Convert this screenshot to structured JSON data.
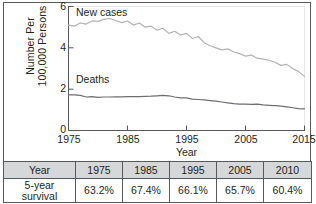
{
  "chart_data": {
    "type": "line",
    "title": "",
    "xlabel": "Year",
    "ylabel": "Number Per 100,000 Persons",
    "ylabel_lines": [
      "Number Per",
      "100,000 Persons"
    ],
    "xlim": [
      1975,
      2015
    ],
    "ylim": [
      0,
      6
    ],
    "yticks": [
      "0",
      "2",
      "4",
      "6"
    ],
    "ytick_values": [
      0,
      2,
      4,
      6
    ],
    "xticks": [
      "1975",
      "1985",
      "1995",
      "2005",
      "2015"
    ],
    "xtick_values": [
      1975,
      1985,
      1995,
      2005,
      2015
    ],
    "grid": false,
    "legend_position": "inline-annotations",
    "annotations": [
      {
        "text": "New cases",
        "x": 1977,
        "y": 5.9
      },
      {
        "text": "Deaths",
        "x": 1977,
        "y": 2.25
      }
    ],
    "series": [
      {
        "name": "New cases",
        "color": "#b3b3b3",
        "x": [
          1975,
          1976,
          1977,
          1978,
          1979,
          1980,
          1981,
          1982,
          1983,
          1984,
          1985,
          1986,
          1987,
          1988,
          1989,
          1990,
          1991,
          1992,
          1993,
          1994,
          1995,
          1996,
          1997,
          1998,
          1999,
          2000,
          2001,
          2002,
          2003,
          2004,
          2005,
          2006,
          2007,
          2008,
          2009,
          2010,
          2011,
          2012,
          2013,
          2014,
          2015
        ],
        "values": [
          5.1,
          5.05,
          5.2,
          5.15,
          5.3,
          5.28,
          5.38,
          5.42,
          5.32,
          5.22,
          5.3,
          5.1,
          5.2,
          5.0,
          5.05,
          4.85,
          4.95,
          4.7,
          4.8,
          4.62,
          4.7,
          4.45,
          4.55,
          4.25,
          4.1,
          4.0,
          3.9,
          3.95,
          3.8,
          3.72,
          3.6,
          3.65,
          3.5,
          3.45,
          3.4,
          3.3,
          3.15,
          3.2,
          3.0,
          2.85,
          2.62
        ]
      },
      {
        "name": "Deaths",
        "color": "#6d6e71",
        "x": [
          1975,
          1976,
          1977,
          1978,
          1979,
          1980,
          1981,
          1982,
          1983,
          1984,
          1985,
          1986,
          1987,
          1988,
          1989,
          1990,
          1991,
          1992,
          1993,
          1994,
          1995,
          1996,
          1997,
          1998,
          1999,
          2000,
          2001,
          2002,
          2003,
          2004,
          2005,
          2006,
          2007,
          2008,
          2009,
          2010,
          2011,
          2012,
          2013,
          2014,
          2015
        ],
        "values": [
          1.72,
          1.72,
          1.7,
          1.62,
          1.64,
          1.6,
          1.62,
          1.62,
          1.63,
          1.63,
          1.64,
          1.64,
          1.64,
          1.65,
          1.66,
          1.68,
          1.7,
          1.68,
          1.62,
          1.58,
          1.58,
          1.52,
          1.5,
          1.48,
          1.45,
          1.42,
          1.38,
          1.34,
          1.3,
          1.28,
          1.28,
          1.26,
          1.28,
          1.24,
          1.22,
          1.2,
          1.18,
          1.14,
          1.1,
          1.06,
          1.05
        ]
      }
    ]
  },
  "table": {
    "headers": [
      "Year",
      "1975",
      "1985",
      "1995",
      "2005",
      "2010"
    ],
    "rows": [
      {
        "label_lines": [
          "5-year",
          "survival"
        ],
        "label": "5-year survival",
        "values": [
          "63.2%",
          "67.4%",
          "66.1%",
          "65.7%",
          "60.4%"
        ]
      }
    ]
  },
  "colors": {
    "new_cases_line": "#b3b3b3",
    "deaths_line": "#6d6e71",
    "axis": "#58595b",
    "text": "#231f20",
    "table_header_bg": "#d6d7d9",
    "table_border": "#58595b"
  }
}
